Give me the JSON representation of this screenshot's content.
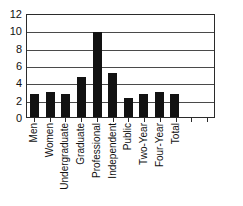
{
  "chart_data": {
    "type": "bar",
    "title": "",
    "xlabel": "",
    "ylabel": "",
    "ylim": [
      0,
      12
    ],
    "yticks": [
      0,
      2,
      4,
      6,
      8,
      10,
      12
    ],
    "ytick_labels": [
      "0",
      "2",
      "4",
      "6",
      "8",
      "10",
      "12"
    ],
    "grid": true,
    "legend": false,
    "bar_color": "#121212",
    "axis_color": "#2b2b2b",
    "categories": [
      "Men",
      "Women",
      "Undergraduate",
      "Graduate",
      "Professional",
      "Independent",
      "Public",
      "Two-Year",
      "Four-Year",
      "Total",
      "",
      ""
    ],
    "values": [
      2.6,
      2.9,
      2.7,
      4.6,
      9.8,
      5.1,
      2.2,
      2.6,
      2.85,
      2.7,
      null,
      null
    ]
  }
}
